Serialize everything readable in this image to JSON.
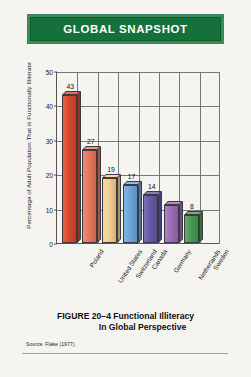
{
  "banner": {
    "title": "GLOBAL SNAPSHOT",
    "background_color": "#15703c",
    "border_color": "#3a8a55",
    "text_color": "#ffffff"
  },
  "caption": {
    "line1": "FIGURE 20–4  Functional Illiteracy",
    "line2": "In Global Perspective",
    "source": "Source:  Flake (1977),"
  },
  "chart_data": {
    "type": "bar",
    "title": "",
    "xlabel": "",
    "ylabel": "Percentage of Adult Population That is Functionally Illiterate",
    "ylim": [
      0,
      50
    ],
    "yticks": [
      "0",
      "10",
      "20",
      "30",
      "40",
      "50"
    ],
    "ytick_values": [
      0,
      10,
      20,
      30,
      40,
      50
    ],
    "grid": true,
    "legend": "none",
    "categories": [
      "Poland",
      "United States",
      "Switzerland",
      "Canada",
      "Germany",
      "Netherlands",
      "Sweden"
    ],
    "values": [
      43,
      27,
      19,
      17,
      14,
      11,
      8
    ],
    "value_labels": [
      "43",
      "27",
      "19",
      "17",
      "14",
      "",
      "8"
    ],
    "colors": [
      "#d9462a",
      "#e8775a",
      "#f0cf92",
      "#6aa6dc",
      "#6358a8",
      "#9b6bb5",
      "#489a54"
    ]
  }
}
